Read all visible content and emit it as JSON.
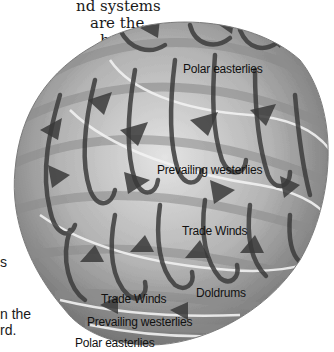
{
  "page_text": {
    "lines_top": [
      "nd systems",
      "are  the",
      "hese",
      "he"
    ],
    "line_mid": "s",
    "lines_bottom": [
      "n the",
      "rd."
    ]
  },
  "figure": {
    "colors": {
      "globe_light": "#d9d9d9",
      "globe_mid": "#a8a8a8",
      "globe_dark": "#5e5e5e",
      "arrow": "#3a3a3a",
      "band_line": "#efefef"
    },
    "labels": [
      {
        "text": "Polar easterlies",
        "x": 183,
        "y": 62
      },
      {
        "text": "Prevailing westerlies",
        "x": 157,
        "y": 170
      },
      {
        "text": "Trade Winds",
        "x": 182,
        "y": 229
      },
      {
        "text": "Doldrums",
        "x": 196,
        "y": 286
      },
      {
        "text": "Trade Winds",
        "x": 101,
        "y": 292
      },
      {
        "text": "Prevailing westerlies",
        "x": 87,
        "y": 316
      },
      {
        "text": "Polar easterlies",
        "x": 75,
        "y": 338
      }
    ]
  }
}
